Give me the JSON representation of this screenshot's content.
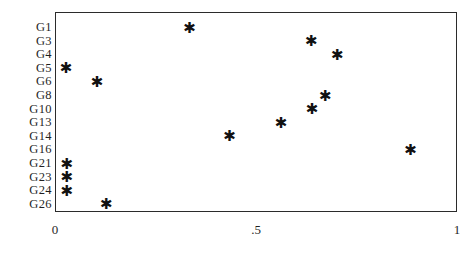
{
  "chart_data": {
    "type": "scatter",
    "title": "",
    "subtitle": "",
    "xlabel": "",
    "ylabel": "",
    "marker": "asterisk",
    "marker_color": "#111111",
    "grid": false,
    "legend": null,
    "frame": true,
    "xlim": [
      0,
      1
    ],
    "xticks": [
      0,
      0.5,
      1
    ],
    "xtick_labels": [
      "0",
      ".5",
      "1"
    ],
    "categories": [
      "G1",
      "G3",
      "G4",
      "G5",
      "G6",
      "G8",
      "G10",
      "G13",
      "G14",
      "G16",
      "G21",
      "G23",
      "G24",
      "G26"
    ],
    "points": [
      {
        "category": "G1",
        "x": 0.33
      },
      {
        "category": "G3",
        "x": 0.633
      },
      {
        "category": "G4",
        "x": 0.698
      },
      {
        "category": "G5",
        "x": 0.023
      },
      {
        "category": "G6",
        "x": 0.1
      },
      {
        "category": "G8",
        "x": 0.668
      },
      {
        "category": "G10",
        "x": 0.635
      },
      {
        "category": "G13",
        "x": 0.558
      },
      {
        "category": "G14",
        "x": 0.43
      },
      {
        "category": "G16",
        "x": 0.88
      },
      {
        "category": "G21",
        "x": 0.025
      },
      {
        "category": "G23",
        "x": 0.025
      },
      {
        "category": "G24",
        "x": 0.025
      },
      {
        "category": "G26",
        "x": 0.123
      }
    ],
    "values": [
      0.33,
      0.633,
      0.698,
      0.023,
      0.1,
      0.668,
      0.635,
      0.558,
      0.43,
      0.88,
      0.025,
      0.025,
      0.025,
      0.123
    ],
    "marker_glyph": "✱"
  },
  "layout": {
    "plot_left_px": 55,
    "plot_top_px": 12,
    "plot_width_px": 402,
    "plot_height_px": 200,
    "row_spacing_px": 13.6,
    "first_row_center_px": 27
  }
}
